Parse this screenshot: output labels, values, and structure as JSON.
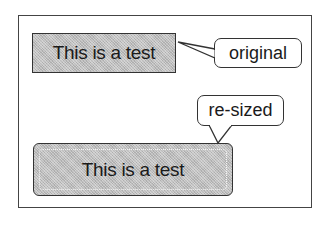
{
  "diagram": {
    "original": {
      "box_text": "This is a test",
      "callout_label": "original"
    },
    "resized": {
      "box_text": "This is a test",
      "callout_label": "re-sized"
    }
  },
  "colors": {
    "fill": "#bdbdbd",
    "stroke": "#333333",
    "background": "#ffffff"
  }
}
